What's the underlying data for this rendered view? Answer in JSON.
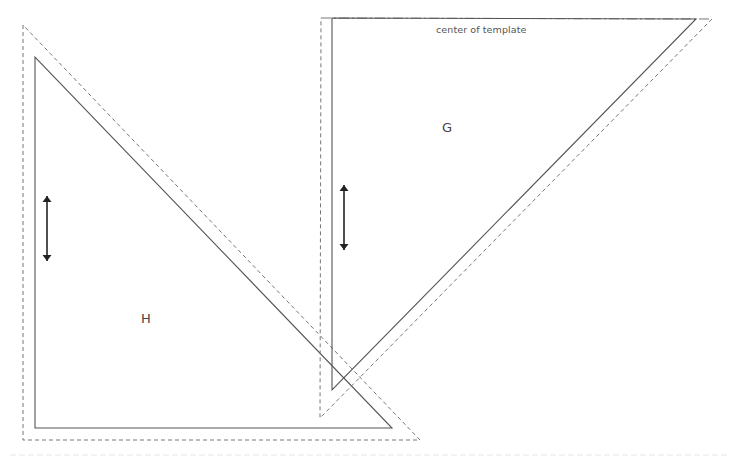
{
  "diagram": {
    "type": "sewing-pattern-template",
    "colors": {
      "stroke": "#555555",
      "dashed": "#777777",
      "background": "#ffffff"
    },
    "pieces": [
      {
        "id": "H",
        "label": "H",
        "shape": "right-triangle",
        "cut_line": [
          [
            35,
            57
          ],
          [
            35,
            428
          ],
          [
            392,
            428
          ]
        ],
        "seam_allowance_line": [
          [
            23,
            25
          ],
          [
            23,
            440
          ],
          [
            420,
            440
          ]
        ],
        "grainline_arrow": {
          "x": 47,
          "y1": 193,
          "y2": 264
        },
        "label_pos": [
          146,
          319
        ]
      },
      {
        "id": "G",
        "label": "G",
        "shape": "right-triangle",
        "cut_line": [
          [
            332,
            18
          ],
          [
            696,
            19
          ],
          [
            332,
            390
          ]
        ],
        "seam_allowance_line": [
          [
            321,
            18
          ],
          [
            712,
            19
          ],
          [
            320,
            418
          ]
        ],
        "grainline_arrow": {
          "x": 344,
          "y1": 182,
          "y2": 253
        },
        "label_pos": [
          447,
          128
        ],
        "fold_note": "center of template"
      }
    ]
  }
}
